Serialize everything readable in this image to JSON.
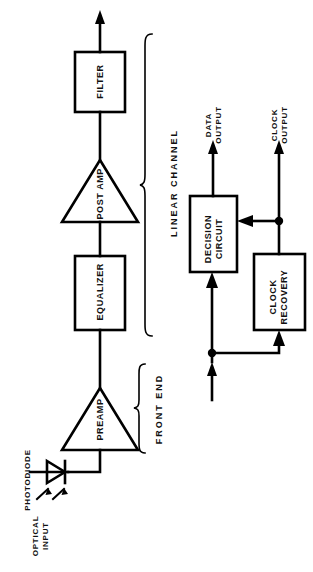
{
  "diagram": {
    "orientation": "rotated-90",
    "stroke_color": "#000000",
    "background_color": "#ffffff"
  },
  "blocks": [
    {
      "id": "filter",
      "label": "FILTER",
      "shape": "rect",
      "x": 75,
      "y": 52,
      "w": 50,
      "h": 60
    },
    {
      "id": "post-amp",
      "label": "POST AMP",
      "shape": "triangle",
      "x": 62,
      "y": 160,
      "w": 76,
      "h": 62
    },
    {
      "id": "equalizer",
      "label": "EQUALIZER",
      "shape": "rect",
      "x": 75,
      "y": 256,
      "w": 50,
      "h": 74
    },
    {
      "id": "preamp",
      "label": "PREAMP",
      "shape": "triangle",
      "x": 62,
      "y": 388,
      "w": 76,
      "h": 62
    },
    {
      "id": "decision-circuit",
      "label": "DECISION\nCIRCUIT",
      "shape": "rect",
      "x": 190,
      "y": 196,
      "w": 47,
      "h": 76
    },
    {
      "id": "clock-recovery",
      "label": "CLOCK\nRECOVERY",
      "shape": "rect",
      "x": 254,
      "y": 254,
      "w": 51,
      "h": 76
    }
  ],
  "components": [
    {
      "id": "photodiode",
      "label": "PHOTODIODE",
      "shape": "diode-symbol"
    }
  ],
  "group_braces": [
    {
      "id": "linear-channel",
      "label": "LINEAR CHANNEL",
      "y_top": 32,
      "y_bottom": 338
    },
    {
      "id": "front-end",
      "label": "FRONT END",
      "y_top": 362,
      "y_bottom": 456
    }
  ],
  "io_labels": [
    {
      "id": "optical-input",
      "lines": "OPTICAL\nINPUT",
      "line1": "OPTICAL",
      "line2": "INPUT"
    },
    {
      "id": "data-output",
      "lines": "DATA\nOUTPUT",
      "line1": "DATA",
      "line2": "OUTPUT"
    },
    {
      "id": "clock-output",
      "lines": "CLOCK\nOUTPUT",
      "line1": "CLOCK",
      "line2": "OUTPUT"
    }
  ],
  "signal_flow": [
    "optical-input -> photodiode",
    "photodiode -> preamp",
    "preamp -> equalizer",
    "equalizer -> post-amp",
    "post-amp -> filter",
    "filter -> data-output-chain",
    "input-junction -> decision-circuit",
    "input-junction -> clock-recovery",
    "clock-recovery -> decision-circuit",
    "clock-recovery -> clock-output",
    "decision-circuit -> data-output"
  ]
}
